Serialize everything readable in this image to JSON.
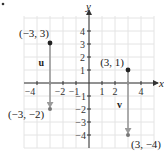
{
  "figure": {
    "marker": "•",
    "axes": {
      "x_label": "x",
      "y_label": "y",
      "x_ticks": [
        {
          "value": -4,
          "label": "−4"
        },
        {
          "value": -2,
          "label": "−2"
        },
        {
          "value": -1,
          "label": "−1"
        },
        {
          "value": 1,
          "label": "1"
        },
        {
          "value": 2,
          "label": "2"
        },
        {
          "value": 4,
          "label": "4"
        }
      ],
      "y_ticks": [
        {
          "value": 4,
          "label": "4"
        },
        {
          "value": 3,
          "label": "3"
        },
        {
          "value": 2,
          "label": "2"
        },
        {
          "value": 1,
          "label": "1"
        },
        {
          "value": -1,
          "label": "−1"
        },
        {
          "value": -2,
          "label": "−2"
        },
        {
          "value": -3,
          "label": "−3"
        },
        {
          "value": -4,
          "label": "−4"
        }
      ]
    },
    "vectors": [
      {
        "name": "u",
        "start": {
          "x": -3,
          "y": 3,
          "label": "(−3, 3)"
        },
        "end": {
          "x": -3,
          "y": -2,
          "label": "(−3, −2)"
        }
      },
      {
        "name": "v",
        "start": {
          "x": 3,
          "y": 1,
          "label": "(3, 1)"
        },
        "end": {
          "x": 3,
          "y": -4,
          "label": "(3, −4)"
        }
      }
    ],
    "colors": {
      "grid": "#e4e4e4",
      "axis": "#333333",
      "vector": "#9a9a9a",
      "point": "#222222"
    }
  },
  "chart_data": {
    "type": "scatter",
    "title": "",
    "xlabel": "x",
    "ylabel": "y",
    "xlim": [
      -5,
      5
    ],
    "ylim": [
      -5,
      5
    ],
    "grid": true,
    "series": [
      {
        "name": "u",
        "points": [
          {
            "x": -3,
            "y": 3
          },
          {
            "x": -3,
            "y": -2
          }
        ],
        "annotations": [
          "(−3, 3)",
          "(−3, −2)"
        ]
      },
      {
        "name": "v",
        "points": [
          {
            "x": 3,
            "y": 1
          },
          {
            "x": 3,
            "y": -4
          }
        ],
        "annotations": [
          "(3, 1)",
          "(3, −4)"
        ]
      }
    ]
  }
}
